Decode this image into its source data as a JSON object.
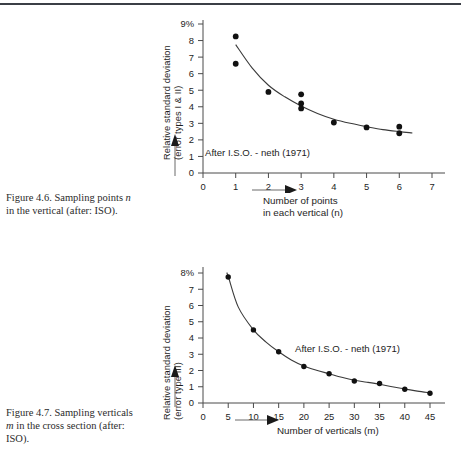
{
  "page": {
    "top_rule_color": "#3b3f46",
    "background": "#ffffff"
  },
  "figures": [
    {
      "id": "figure-4-6",
      "caption_prefix": "Figure 4.6. Sampling points ",
      "caption_italic": "n",
      "caption_suffix": "",
      "caption_line2": "in the vertical (after: ISO).",
      "ytitle_line1": "Relative standard deviation",
      "ytitle_line2": "(error types I & II)",
      "xtitle_line1": "Number of points",
      "xtitle_line2": "in each vertical (n)",
      "annotation": "After I.S.O. - neth (1971)",
      "y_top_label": "9%"
    },
    {
      "id": "figure-4-7",
      "caption_prefix": "Figure 4.7. Sampling verticals",
      "caption_italic": "m",
      "caption_suffix": " in the cross section (after:",
      "caption_line2": "ISO).",
      "ytitle_line1": "Relative standard deviation",
      "ytitle_line2": "(error type III)",
      "xtitle_line1": "Number of verticals (m)",
      "xtitle_line2": "",
      "annotation": "After I.S.O. - neth (1971)",
      "y_top_label": "8%"
    }
  ],
  "chart_data": [
    {
      "type": "scatter",
      "title": "Figure 4.6. Sampling points n in the vertical (after: ISO)",
      "xlabel": "Number of points in each vertical (n)",
      "ylabel": "Relative standard deviation (error types I & II)",
      "xlim": [
        0,
        7
      ],
      "ylim": [
        0,
        9
      ],
      "xticks": [
        0,
        1,
        2,
        3,
        4,
        5,
        6,
        7
      ],
      "yticks": [
        0,
        1,
        2,
        3,
        4,
        5,
        6,
        7,
        8,
        9
      ],
      "ytick_labels": [
        "0",
        "1",
        "2",
        "3",
        "4",
        "5",
        "6",
        "7",
        "8",
        "9%"
      ],
      "grid": false,
      "legend": "none",
      "annotations": [
        "After I.S.O. - neth (1971)"
      ],
      "points": [
        {
          "x": 1,
          "y": 8.25
        },
        {
          "x": 1,
          "y": 6.6
        },
        {
          "x": 2,
          "y": 4.9
        },
        {
          "x": 3,
          "y": 4.75
        },
        {
          "x": 3,
          "y": 4.2
        },
        {
          "x": 3,
          "y": 3.9
        },
        {
          "x": 4,
          "y": 3.05
        },
        {
          "x": 5,
          "y": 2.75
        },
        {
          "x": 6,
          "y": 2.8
        },
        {
          "x": 6,
          "y": 2.4
        }
      ],
      "fit_curve": [
        {
          "x": 1.0,
          "y": 7.75
        },
        {
          "x": 1.5,
          "y": 6.35
        },
        {
          "x": 2.0,
          "y": 5.3
        },
        {
          "x": 2.5,
          "y": 4.6
        },
        {
          "x": 3.0,
          "y": 4.05
        },
        {
          "x": 3.5,
          "y": 3.6
        },
        {
          "x": 4.0,
          "y": 3.25
        },
        {
          "x": 4.5,
          "y": 3.0
        },
        {
          "x": 5.0,
          "y": 2.8
        },
        {
          "x": 5.5,
          "y": 2.62
        },
        {
          "x": 6.0,
          "y": 2.5
        },
        {
          "x": 6.4,
          "y": 2.42
        }
      ]
    },
    {
      "type": "scatter",
      "title": "Figure 4.7. Sampling verticals m in the cross section (after: ISO)",
      "xlabel": "Number of verticals (m)",
      "ylabel": "Relative standard deviation (error type III)",
      "xlim": [
        0,
        45
      ],
      "ylim": [
        0,
        8
      ],
      "xticks": [
        0,
        5,
        10,
        15,
        20,
        25,
        30,
        35,
        40,
        45
      ],
      "yticks": [
        0,
        1,
        2,
        3,
        4,
        5,
        6,
        7,
        8
      ],
      "ytick_labels": [
        "0",
        "1",
        "2",
        "3",
        "4",
        "5",
        "6",
        "7",
        "8%"
      ],
      "grid": false,
      "legend": "none",
      "annotations": [
        "After I.S.O. - neth (1971)"
      ],
      "points": [
        {
          "x": 5,
          "y": 7.75
        },
        {
          "x": 10,
          "y": 4.5
        },
        {
          "x": 15,
          "y": 3.15
        },
        {
          "x": 20,
          "y": 2.25
        },
        {
          "x": 25,
          "y": 1.8
        },
        {
          "x": 30,
          "y": 1.35
        },
        {
          "x": 35,
          "y": 1.2
        },
        {
          "x": 40,
          "y": 0.85
        },
        {
          "x": 45,
          "y": 0.6
        }
      ],
      "fit_curve": [
        {
          "x": 4.7,
          "y": 8.0
        },
        {
          "x": 5,
          "y": 7.8
        },
        {
          "x": 7,
          "y": 5.9
        },
        {
          "x": 10,
          "y": 4.5
        },
        {
          "x": 12.5,
          "y": 3.75
        },
        {
          "x": 15,
          "y": 3.15
        },
        {
          "x": 17.5,
          "y": 2.65
        },
        {
          "x": 20,
          "y": 2.28
        },
        {
          "x": 22.5,
          "y": 2.02
        },
        {
          "x": 25,
          "y": 1.8
        },
        {
          "x": 27.5,
          "y": 1.58
        },
        {
          "x": 30,
          "y": 1.4
        },
        {
          "x": 32.5,
          "y": 1.28
        },
        {
          "x": 35,
          "y": 1.15
        },
        {
          "x": 37.5,
          "y": 1.0
        },
        {
          "x": 40,
          "y": 0.87
        },
        {
          "x": 42.5,
          "y": 0.73
        },
        {
          "x": 45,
          "y": 0.62
        }
      ]
    }
  ]
}
